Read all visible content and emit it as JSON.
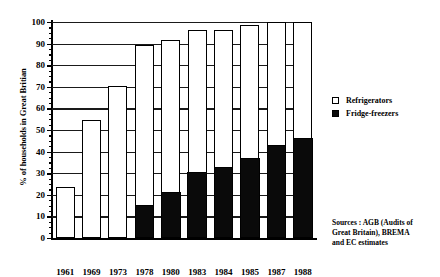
{
  "chart_data": {
    "type": "bar",
    "title": "",
    "subtitle": "",
    "xlabel": "",
    "ylabel": "% of households in Great Britian",
    "ylim": [
      0,
      100
    ],
    "ytick_step": 10,
    "yticks": [
      0,
      10,
      20,
      30,
      40,
      50,
      60,
      70,
      80,
      90,
      100
    ],
    "grid": true,
    "grid_axis": "y",
    "stacked": true,
    "legend_position": "right",
    "categories": [
      "1961",
      "1969",
      "1973",
      "1978",
      "1980",
      "1983",
      "1984",
      "1985",
      "1987",
      "1988"
    ],
    "series": [
      {
        "name": "Fridge-freezers",
        "color": "#0a0a0a",
        "values": [
          0,
          0,
          0,
          14.5,
          20.5,
          30,
          32,
          36.5,
          42.5,
          45.5
        ]
      },
      {
        "name": "Refrigerators",
        "color": "#ffffff",
        "values": [
          23.5,
          54.5,
          70.5,
          75,
          71,
          66.5,
          64.5,
          62,
          57.5,
          54.5
        ]
      }
    ],
    "totals": [
      23.5,
      54.5,
      70.5,
      89.5,
      91.5,
      96.5,
      96.5,
      98.5,
      100,
      100
    ],
    "annotations": [
      "Sources : AGB (Audits of",
      "Great Britain), BREMA",
      "and EC estimates"
    ]
  },
  "legend": {
    "items": [
      {
        "label": "Refrigerators",
        "swatch": "hollow"
      },
      {
        "label": "Fridge-freezers",
        "swatch": "filled"
      }
    ]
  },
  "sources": {
    "line1": "Sources : AGB (Audits of",
    "line2": "Great Britain), BREMA",
    "line3": "and EC estimates"
  }
}
